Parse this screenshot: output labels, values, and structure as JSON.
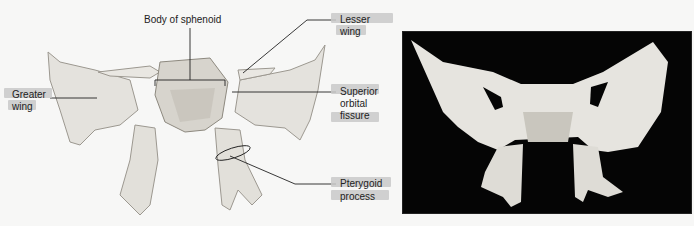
{
  "labels": {
    "body": "Body of sphenoid",
    "lesser1": "Lesser",
    "lesser2": "wing",
    "greater1": "Greater",
    "greater2": "wing",
    "sup1": "Superior",
    "sup2": "orbital",
    "sup3": "fissure",
    "ptery1": "Pterygoid",
    "ptery2": "process"
  },
  "colors": {
    "bone": "#e4e2dd",
    "bone_shade": "#b9b6ae",
    "photo_bg": "#050505",
    "tag": "#c9c9c9"
  }
}
